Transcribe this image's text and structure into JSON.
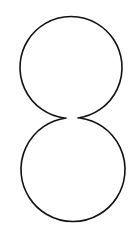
{
  "diagram": {
    "type": "figure-eight-circles",
    "stroke_color": "#111111",
    "background": "#ffffff",
    "shapes": [
      {
        "name": "top-circle",
        "cx": 70,
        "cy": 65,
        "r": 51
      },
      {
        "name": "bottom-circle",
        "cx": 72,
        "cy": 172,
        "r": 51
      }
    ],
    "gap": {
      "x1": 66,
      "x2": 76,
      "y": 118
    }
  }
}
